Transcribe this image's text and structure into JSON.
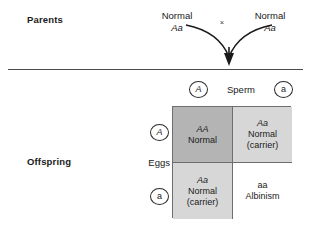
{
  "labels": {
    "parents": "Parents",
    "offspring": "Offspring",
    "sperm": "Sperm",
    "eggs": "Eggs",
    "cross_symbol": "×"
  },
  "parents": {
    "left": {
      "phenotype": "Normal",
      "genotype": "Aa"
    },
    "right": {
      "phenotype": "Normal",
      "genotype": "Aa"
    }
  },
  "gametes": {
    "sperm": [
      {
        "allele": "A",
        "style": "italic"
      },
      {
        "allele": "a",
        "style": "roman"
      }
    ],
    "eggs": [
      {
        "allele": "A",
        "style": "italic"
      },
      {
        "allele": "a",
        "style": "roman"
      }
    ]
  },
  "punnett": {
    "cells": [
      {
        "id": "AA",
        "genotype": "AA",
        "phenotype": "Normal",
        "note": "",
        "fill": "#b4b4b4"
      },
      {
        "id": "Aa-top",
        "genotype": "Aa",
        "phenotype": "Normal",
        "note": "(carrier)",
        "fill": "#d7d7d7"
      },
      {
        "id": "Aa-bottom",
        "genotype": "Aa",
        "phenotype": "Normal",
        "note": "(carrier)",
        "fill": "#d7d7d7"
      },
      {
        "id": "aa",
        "genotype": "aa",
        "phenotype": "Albinism",
        "note": "",
        "fill": "#ffffff"
      }
    ]
  },
  "colors": {
    "rule": "#4a4a4a",
    "grid_border": "#6e6e6e",
    "text": "#1a1a1a"
  }
}
